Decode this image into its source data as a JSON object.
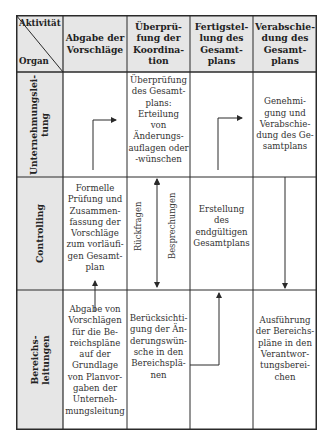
{
  "diagram": {
    "corner": {
      "top_label": "Aktivität",
      "bottom_label": "Organ"
    },
    "columns": [
      {
        "label": "Abgabe der Vorschläge",
        "lines": [
          "Abgabe der",
          "Vorschläge"
        ]
      },
      {
        "label": "Überprüfung der Koordination",
        "lines": [
          "Überprü-",
          "fung der",
          "Koordina-",
          "tion"
        ]
      },
      {
        "label": "Fertigstellung des Gesamtplans",
        "lines": [
          "Fertigstel-",
          "lung des",
          "Gesamt-",
          "plans"
        ]
      },
      {
        "label": "Verabschiedung des Gesamtplans",
        "lines": [
          "Verabschie-",
          "dung des",
          "Gesamt-",
          "plans"
        ]
      }
    ],
    "rows": [
      {
        "organ": "Unternehmungsleitung",
        "organ_lines": [
          "Unternehmungslei-",
          "tung"
        ],
        "cells": [
          "",
          "Überprüfung des Gesamtplans: Erteilung von Änderungsauflagen oder -wünschen",
          "",
          "Genehmigung und Verabschiedung des Gesamtplans"
        ],
        "cell_lines": [
          [],
          [
            "Überprüfung",
            "des Gesamt-",
            "plans:",
            "Erteilung",
            "von",
            "Änderungs-",
            "auflagen oder",
            "-wünschen"
          ],
          [],
          [
            "Genehmi-",
            "gung und",
            "Verabschie-",
            "dung des Ge-",
            "samtplans"
          ]
        ]
      },
      {
        "organ": "Controlling",
        "organ_lines": [
          "Controlling"
        ],
        "cells": [
          "Formelle Prüfung und Zusammenfassung der Vorschläge zum vorläufigen Gesamtplan",
          "",
          "Erstellung des endgültigen Gesamtplans",
          ""
        ],
        "cell_lines": [
          [
            "Formelle",
            "Prüfung und",
            "Zusammen-",
            "fassung der",
            "Vorschläge",
            "zum vorläufi-",
            "gen Gesamt-",
            "plan"
          ],
          [],
          [
            "Erstellung",
            "des",
            "endgültigen",
            "Gesamtplans"
          ],
          []
        ],
        "arrow_labels": [
          "Rückfragen",
          "Besprechungen"
        ]
      },
      {
        "organ": "Bereichsleitungen",
        "organ_lines": [
          "Bereichs-",
          "leitungen"
        ],
        "cells": [
          "Abgabe von Vorschlägen für die Bereichspläne auf der Grundlage von Planvorgaben der Unternehmungsleitung",
          "Berücksichtigung der Änderungswünsche in den Bereichsplänen",
          "",
          "Ausführung der Bereichspläne in den Verantwortungsbereichen"
        ],
        "cell_lines": [
          [
            "Abgabe von",
            "Vorschlägen",
            "für die Be-",
            "reichspläne",
            "auf der",
            "Grundlage",
            "von Planvor-",
            "gaben der",
            "Unterneh-",
            "mungsleitung"
          ],
          [
            "Berücksichti-",
            "gung der Än-",
            "derungswün-",
            "sche in den",
            "Bereichsplä-",
            "nen"
          ],
          [],
          [
            "Ausführung",
            "der Bereichs-",
            "pläne in den",
            "Verantwor-",
            "tungsberei-",
            "chen"
          ]
        ]
      }
    ],
    "colors": {
      "header_bg": "#e6e6e6",
      "line": "#2a2a2a",
      "cell_bg": "#ffffff"
    }
  }
}
